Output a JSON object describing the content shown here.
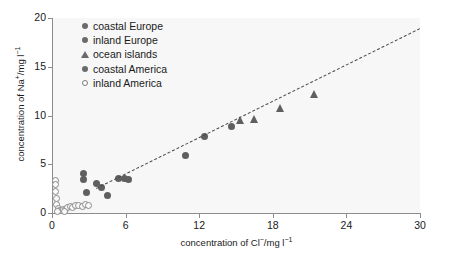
{
  "chart_data": {
    "type": "scatter",
    "title": "",
    "xlabel": "concentration of Cl−/mg l−1",
    "ylabel": "concentration of Na⁺/mg l−1",
    "xlim": [
      0,
      30
    ],
    "ylim": [
      0,
      20
    ],
    "xticks": [
      0,
      6,
      12,
      18,
      24,
      30
    ],
    "yticks": [
      0,
      5,
      10,
      15,
      20
    ],
    "grid": false,
    "legend_position": "top-left-inside",
    "series": [
      {
        "name": "coastal Europe",
        "marker": "filled-circle",
        "color": "#5f5f5f",
        "points": [
          [
            10.9,
            5.9
          ],
          [
            12.4,
            7.8
          ],
          [
            14.6,
            8.9
          ]
        ]
      },
      {
        "name": "inland Europe",
        "marker": "filled-circle",
        "color": "#5f5f5f",
        "points": [
          [
            2.6,
            4.1
          ],
          [
            2.6,
            3.4
          ],
          [
            2.8,
            2.1
          ],
          [
            4.0,
            2.6
          ],
          [
            4.5,
            1.8
          ],
          [
            5.4,
            3.5
          ],
          [
            5.9,
            3.5
          ],
          [
            6.2,
            3.4
          ]
        ]
      },
      {
        "name": "ocean islands",
        "marker": "filled-triangle",
        "color": "#5f5f5f",
        "points": [
          [
            15.4,
            9.5
          ],
          [
            16.5,
            9.6
          ],
          [
            18.6,
            10.8
          ],
          [
            21.4,
            12.2
          ]
        ]
      },
      {
        "name": "coastal America",
        "marker": "filled-circle",
        "color": "#5f5f5f",
        "points": [
          [
            3.6,
            3.0
          ]
        ]
      },
      {
        "name": "inland America",
        "marker": "open-circle",
        "color": "#ffffff",
        "points": [
          [
            0.25,
            3.3
          ],
          [
            0.25,
            2.9
          ],
          [
            0.3,
            2.2
          ],
          [
            0.35,
            1.5
          ],
          [
            0.4,
            0.9
          ],
          [
            0.5,
            0.45
          ],
          [
            0.6,
            0.3
          ],
          [
            0.75,
            0.25
          ],
          [
            0.9,
            0.35
          ],
          [
            1.1,
            0.4
          ],
          [
            1.3,
            0.55
          ],
          [
            1.5,
            0.7
          ],
          [
            1.7,
            0.55
          ],
          [
            1.95,
            0.8
          ],
          [
            2.2,
            0.75
          ],
          [
            2.5,
            0.7
          ],
          [
            2.75,
            0.85
          ],
          [
            3.0,
            0.8
          ],
          [
            0.45,
            0.15
          ],
          [
            1.0,
            0.15
          ]
        ]
      }
    ],
    "trendline": {
      "style": "dashed",
      "color": "#4a4a4a",
      "from": [
        3.6,
        2.6
      ],
      "to": [
        30.0,
        19.0
      ]
    }
  },
  "legend": {
    "items": [
      {
        "label": "coastal Europe",
        "marker": "filled-circle"
      },
      {
        "label": "inland Europe",
        "marker": "filled-circle"
      },
      {
        "label": "ocean islands",
        "marker": "filled-triangle"
      },
      {
        "label": "coastal America",
        "marker": "filled-circle"
      },
      {
        "label": "inland America",
        "marker": "open-circle"
      }
    ]
  },
  "axes": {
    "x_tick_labels": [
      "0",
      "6",
      "12",
      "18",
      "24",
      "30"
    ],
    "y_tick_labels": [
      "0",
      "5",
      "10",
      "15",
      "20"
    ],
    "x_title": "concentration of Cl−/mg l−1",
    "y_title": "concentration of Na⁺/mg l−1"
  }
}
